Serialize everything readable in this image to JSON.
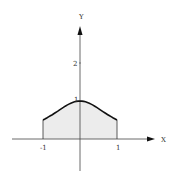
{
  "chart_data": {
    "type": "area",
    "title": "",
    "xlabel": "X",
    "ylabel": "Y",
    "function": "y = 1/(1+x^2)",
    "x": [
      -1,
      -0.75,
      -0.5,
      -0.25,
      0,
      0.25,
      0.5,
      0.75,
      1
    ],
    "values": [
      0.5,
      0.64,
      0.8,
      0.94,
      1.0,
      0.94,
      0.8,
      0.64,
      0.5
    ],
    "shaded_region": {
      "from": -1,
      "to": 1
    },
    "x_ticks": [
      "-1",
      "1"
    ],
    "y_ticks": [
      "1",
      "2"
    ],
    "xlim": [
      -1.5,
      2.1
    ],
    "ylim": [
      -0.8,
      3.0
    ],
    "grid": false,
    "legend": null
  },
  "labels": {
    "x_axis": "X",
    "y_axis": "Y",
    "x_tick_neg1": "-1",
    "x_tick_1": "1",
    "y_tick_1": "1",
    "y_tick_2": "2"
  },
  "colors": {
    "axis": "#222222",
    "curve": "#111111",
    "fill": "#ececec"
  }
}
